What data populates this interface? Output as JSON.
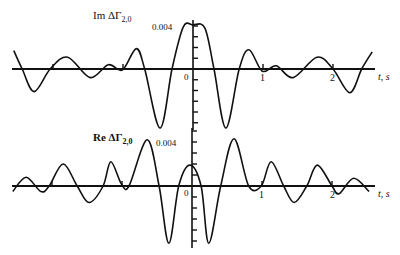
{
  "chart_data": [
    {
      "type": "line",
      "title": "Im ΔΓ2,0",
      "ylabel_main": "Im ΔΓ",
      "ylabel_sub": "2,0",
      "xlabel": "t, s",
      "y_tick_label": "0.004",
      "origin_label": "0",
      "x_tick_labels": [
        "1",
        "2"
      ],
      "x_ticks": [
        -2,
        -1,
        0,
        1,
        2
      ],
      "xlim": [
        -2.6,
        2.6
      ],
      "ylim": [
        -0.0057,
        0.0045
      ],
      "y_minor_tick_step": 0.001,
      "x": [
        -2.56,
        -2.44,
        -2.27,
        -2.04,
        -1.79,
        -1.47,
        -1.21,
        -1.01,
        -0.81,
        -0.69,
        -0.47,
        -0.3,
        -0.14,
        0.0,
        0.17,
        0.3,
        0.47,
        0.66,
        0.8,
        0.99,
        1.19,
        1.43,
        1.77,
        2.0,
        2.24,
        2.41,
        2.56
      ],
      "y": [
        0.0017,
        0.0,
        -0.0021,
        0.0,
        0.0011,
        -0.0008,
        0.0004,
        -0.0001,
        0.0019,
        0.0,
        -0.0055,
        0.0,
        0.0039,
        0.0041,
        0.0038,
        0.0,
        -0.0055,
        0.0,
        0.0018,
        -0.0002,
        0.0003,
        -0.0008,
        0.0011,
        0.0,
        -0.0022,
        0.0,
        0.0016
      ]
    },
    {
      "type": "line",
      "title": "Re ΔΓ2,0",
      "ylabel_main": "Re ΔΓ",
      "ylabel_sub": "2,0",
      "xlabel": "t, s",
      "y_tick_label": "0.004",
      "origin_label": "0",
      "x_tick_labels": [
        "1",
        "2"
      ],
      "x_ticks": [
        -2,
        -1,
        0,
        1,
        2
      ],
      "xlim": [
        -2.6,
        2.6
      ],
      "ylim": [
        -0.0053,
        0.0053
      ],
      "y_minor_tick_step": 0.001,
      "x": [
        -2.56,
        -2.37,
        -2.16,
        -2.04,
        -1.84,
        -1.64,
        -1.47,
        -1.27,
        -1.16,
        -1.01,
        -0.9,
        -0.64,
        -0.47,
        -0.33,
        -0.19,
        -0.03,
        0.13,
        0.24,
        0.41,
        0.6,
        0.81,
        0.99,
        1.13,
        1.31,
        1.46,
        1.64,
        1.79,
        2.0,
        2.1,
        2.31,
        2.53
      ],
      "y": [
        -0.0005,
        0.0008,
        -0.0005,
        0.0,
        0.002,
        0.0,
        -0.0015,
        0.0,
        0.0022,
        0.0002,
        0.0,
        0.0042,
        0.0,
        -0.0052,
        0.0,
        0.0019,
        0.0,
        -0.0052,
        0.0,
        0.0043,
        0.0,
        0.0,
        0.0022,
        0.0,
        -0.0015,
        0.0,
        0.0019,
        0.0,
        -0.0007,
        0.0007,
        -0.0005
      ]
    }
  ],
  "layout": {
    "upper": {
      "origin_x": 193,
      "zero_y": 69,
      "px_per_s": 70,
      "px_per_unit": 10750,
      "axis_x_start": 12,
      "axis_x_end": 375,
      "v_axis_top": 20,
      "v_axis_bottom": 130
    },
    "lower": {
      "origin_x": 192,
      "zero_y": 186,
      "px_per_s": 70,
      "px_per_unit": 11000,
      "axis_x_start": 12,
      "axis_x_end": 375,
      "v_axis_top": 128,
      "v_axis_bottom": 248
    }
  }
}
